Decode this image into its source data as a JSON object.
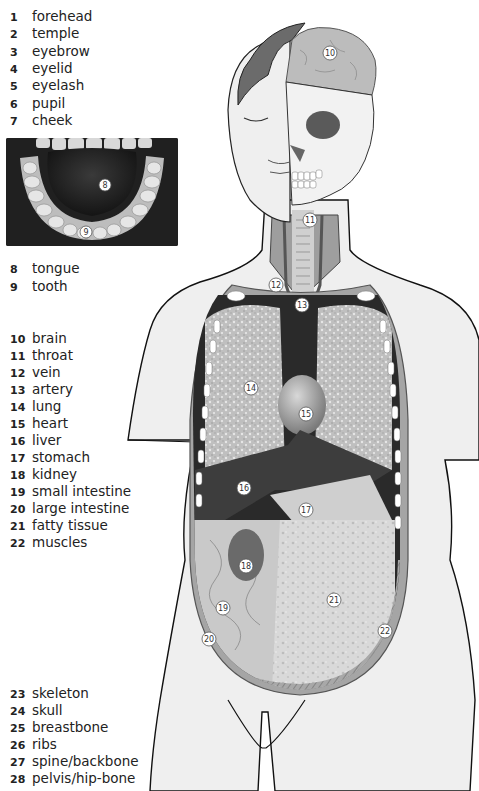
{
  "labels_group_1": [
    {
      "num": "1",
      "text": "forehead"
    },
    {
      "num": "2",
      "text": "temple"
    },
    {
      "num": "3",
      "text": "eyebrow"
    },
    {
      "num": "4",
      "text": "eyelid"
    },
    {
      "num": "5",
      "text": "eyelash"
    },
    {
      "num": "6",
      "text": "pupil"
    },
    {
      "num": "7",
      "text": "cheek"
    }
  ],
  "labels_group_2": [
    {
      "num": "8",
      "text": "tongue"
    },
    {
      "num": "9",
      "text": "tooth"
    }
  ],
  "labels_group_3": [
    {
      "num": "10",
      "text": "brain"
    },
    {
      "num": "11",
      "text": "throat"
    },
    {
      "num": "12",
      "text": "vein"
    },
    {
      "num": "13",
      "text": "artery"
    },
    {
      "num": "14",
      "text": "lung"
    },
    {
      "num": "15",
      "text": "heart"
    },
    {
      "num": "16",
      "text": "liver"
    },
    {
      "num": "17",
      "text": "stomach"
    },
    {
      "num": "18",
      "text": "kidney"
    },
    {
      "num": "19",
      "text": "small intestine"
    },
    {
      "num": "20",
      "text": "large intestine"
    },
    {
      "num": "21",
      "text": "fatty tissue"
    },
    {
      "num": "22",
      "text": "muscles"
    }
  ],
  "labels_group_4": [
    {
      "num": "23",
      "text": "skeleton"
    },
    {
      "num": "24",
      "text": "skull"
    },
    {
      "num": "25",
      "text": "breastbone"
    },
    {
      "num": "26",
      "text": "ribs"
    },
    {
      "num": "27",
      "text": "spine/backbone"
    },
    {
      "num": "28",
      "text": "pelvis/hip-bone"
    }
  ],
  "mouth_photo_markers": [
    "8",
    "9"
  ],
  "figure_markers": [
    "10",
    "11",
    "12",
    "13",
    "14",
    "15",
    "16",
    "17",
    "18",
    "19",
    "20",
    "21",
    "22"
  ]
}
